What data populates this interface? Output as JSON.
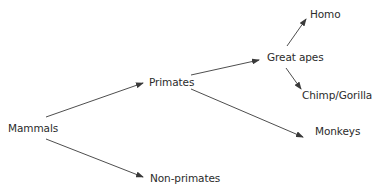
{
  "diagram": {
    "type": "tree",
    "title": "",
    "nodes": {
      "mammals": {
        "label": "Mammals"
      },
      "primates": {
        "label": "Primates"
      },
      "non_primates": {
        "label": "Non-primates"
      },
      "great_apes": {
        "label": "Great apes"
      },
      "monkeys": {
        "label": "Monkeys"
      },
      "homo": {
        "label": "Homo"
      },
      "chimp_gorilla": {
        "label": "Chimp/Gorilla"
      }
    },
    "edges": [
      {
        "from": "Mammals",
        "to": "Primates"
      },
      {
        "from": "Mammals",
        "to": "Non-primates"
      },
      {
        "from": "Primates",
        "to": "Great apes"
      },
      {
        "from": "Primates",
        "to": "Monkeys"
      },
      {
        "from": "Great apes",
        "to": "Homo"
      },
      {
        "from": "Great apes",
        "to": "Chimp/Gorilla"
      }
    ],
    "colors": {
      "text": "#2b2b2b",
      "arrow": "#3a3a3a",
      "background": "#ffffff"
    }
  }
}
